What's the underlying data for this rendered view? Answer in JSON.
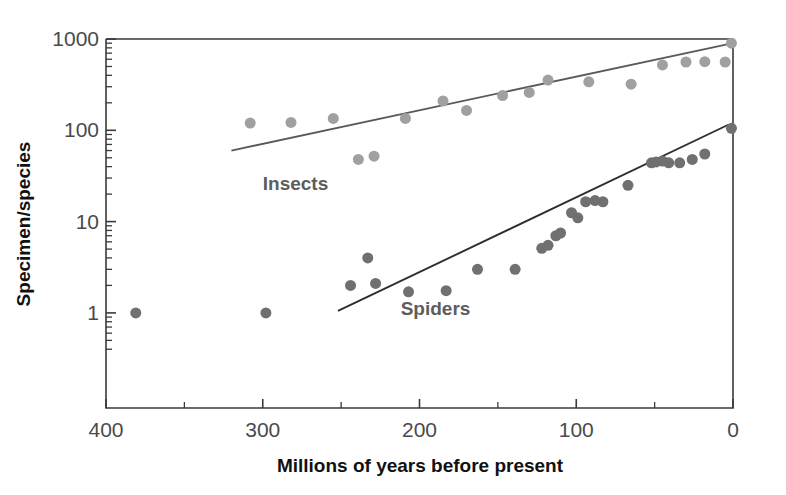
{
  "chart_data": {
    "type": "scatter",
    "title": "",
    "xlabel": "Millions of years before present",
    "ylabel": "Specimen/species",
    "xlim": [
      400,
      0
    ],
    "ylim": [
      0.3,
      1000
    ],
    "x_inverted": true,
    "y_scale": "log",
    "grid": false,
    "legend_position": "inline-annotations",
    "x_ticks_major": [
      400,
      300,
      200,
      100,
      0
    ],
    "x_tick_labels": [
      "400",
      "300",
      "200",
      "100",
      "0"
    ],
    "x_ticks_minor": [
      350,
      250,
      150,
      50
    ],
    "y_ticks_major": [
      1,
      10,
      100,
      1000
    ],
    "y_tick_labels": [
      "1",
      "10",
      "100",
      "1000"
    ],
    "y_ticks_minor": [
      0.4,
      0.5,
      0.6,
      0.7,
      0.8,
      0.9,
      2,
      3,
      4,
      5,
      6,
      7,
      8,
      9,
      20,
      30,
      40,
      50,
      60,
      70,
      80,
      90,
      200,
      300,
      400,
      500,
      600,
      700,
      800,
      900
    ],
    "series": [
      {
        "name": "Insects",
        "label": "Insects",
        "color": "#a0a0a0",
        "marker": "circle",
        "marker_size": 11,
        "points": [
          {
            "x": 308,
            "y": 120
          },
          {
            "x": 282,
            "y": 122
          },
          {
            "x": 255,
            "y": 135
          },
          {
            "x": 239,
            "y": 48
          },
          {
            "x": 229,
            "y": 52
          },
          {
            "x": 209,
            "y": 135
          },
          {
            "x": 185,
            "y": 210
          },
          {
            "x": 170,
            "y": 165
          },
          {
            "x": 147,
            "y": 240
          },
          {
            "x": 130,
            "y": 260
          },
          {
            "x": 118,
            "y": 355
          },
          {
            "x": 92,
            "y": 340
          },
          {
            "x": 65,
            "y": 320
          },
          {
            "x": 45,
            "y": 520
          },
          {
            "x": 30,
            "y": 560
          },
          {
            "x": 18,
            "y": 565
          },
          {
            "x": 5,
            "y": 560
          },
          {
            "x": 1,
            "y": 900
          }
        ],
        "trend": {
          "x1": 320,
          "y1": 60,
          "x2": 3,
          "y2": 880
        },
        "trend_color": "#5a5a5a",
        "trend_width": 1.8,
        "annotation": {
          "text": "Insects",
          "x": 300,
          "y": 22
        }
      },
      {
        "name": "Spiders",
        "label": "Spiders",
        "color": "#707070",
        "marker": "circle",
        "marker_size": 11,
        "points": [
          {
            "x": 381,
            "y": 1.0
          },
          {
            "x": 298,
            "y": 1.0
          },
          {
            "x": 244,
            "y": 2.0
          },
          {
            "x": 233,
            "y": 4.0
          },
          {
            "x": 228,
            "y": 2.1
          },
          {
            "x": 207,
            "y": 1.7
          },
          {
            "x": 183,
            "y": 1.75
          },
          {
            "x": 163,
            "y": 3.0
          },
          {
            "x": 139,
            "y": 3.0
          },
          {
            "x": 122,
            "y": 5.1
          },
          {
            "x": 118,
            "y": 5.5
          },
          {
            "x": 113,
            "y": 7.0
          },
          {
            "x": 110,
            "y": 7.5
          },
          {
            "x": 103,
            "y": 12.5
          },
          {
            "x": 99,
            "y": 11.0
          },
          {
            "x": 94,
            "y": 16.5
          },
          {
            "x": 88,
            "y": 17.0
          },
          {
            "x": 83,
            "y": 16.5
          },
          {
            "x": 67,
            "y": 25.0
          },
          {
            "x": 52,
            "y": 44.0
          },
          {
            "x": 49,
            "y": 45.0
          },
          {
            "x": 45,
            "y": 46.0
          },
          {
            "x": 41,
            "y": 44.0
          },
          {
            "x": 34,
            "y": 44.0
          },
          {
            "x": 26,
            "y": 48.0
          },
          {
            "x": 18,
            "y": 55.0
          },
          {
            "x": 1,
            "y": 105
          }
        ],
        "trend": {
          "x1": 252,
          "y1": 1.05,
          "x2": 3,
          "y2": 115
        },
        "trend_color": "#2e2e2e",
        "trend_width": 1.9,
        "annotation": {
          "text": "Spiders",
          "x": 212,
          "y": 0.95
        }
      }
    ]
  },
  "axes": {
    "x_title": "Millions of years before present",
    "y_title": "Specimen/species"
  }
}
